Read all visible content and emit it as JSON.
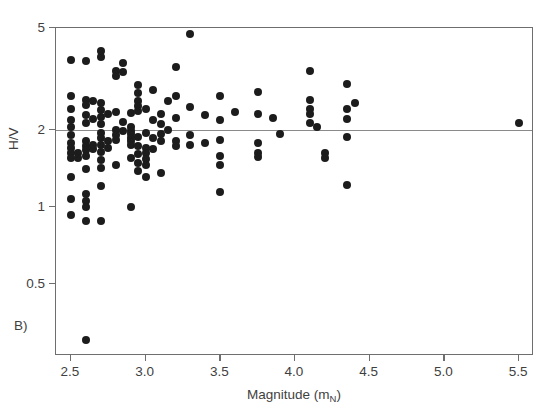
{
  "figure": {
    "panel_label": "B)"
  },
  "chart_data": {
    "type": "scatter",
    "title": "",
    "xlabel": "Magnitude (m_N)",
    "xlabel_base": "Magnitude (m",
    "xlabel_sub": "N",
    "xlabel_tail": ")",
    "ylabel": "H/V",
    "xscale": "linear",
    "yscale": "log",
    "xlim": [
      2.4,
      5.6
    ],
    "ylim": [
      0.26,
      5.0
    ],
    "grid": false,
    "legend": null,
    "xticks": [
      2.5,
      3.0,
      3.5,
      4.0,
      4.5,
      5.0,
      5.5
    ],
    "xticklabels": [
      "2.5",
      "3.0",
      "3.5",
      "4.0",
      "4.5",
      "5.0",
      "5.5"
    ],
    "yticks": [
      5,
      2,
      1,
      0.5
    ],
    "yticklabels": [
      "5",
      "2",
      "1",
      "0.5"
    ],
    "annotations": [
      {
        "type": "hline",
        "y": 2.0,
        "label": "H/V = 2 reference line",
        "color": "#8a8a8a"
      }
    ],
    "marker": {
      "shape": "circle",
      "color": "#1c1c1c",
      "size_px": 8
    },
    "points": [
      [
        2.5,
        3.75
      ],
      [
        2.5,
        2.72
      ],
      [
        2.5,
        2.42
      ],
      [
        2.5,
        2.18
      ],
      [
        2.5,
        2.05
      ],
      [
        2.5,
        1.9
      ],
      [
        2.5,
        1.78
      ],
      [
        2.5,
        1.7
      ],
      [
        2.5,
        1.62
      ],
      [
        2.5,
        1.55
      ],
      [
        2.5,
        1.3
      ],
      [
        2.5,
        1.07
      ],
      [
        2.5,
        0.93
      ],
      [
        2.55,
        1.62
      ],
      [
        2.55,
        1.55
      ],
      [
        2.6,
        3.72
      ],
      [
        2.6,
        2.62
      ],
      [
        2.6,
        2.5
      ],
      [
        2.6,
        2.28
      ],
      [
        2.6,
        2.12
      ],
      [
        2.6,
        1.8
      ],
      [
        2.6,
        1.72
      ],
      [
        2.6,
        1.66
      ],
      [
        2.6,
        1.58
      ],
      [
        2.6,
        1.4
      ],
      [
        2.6,
        1.12
      ],
      [
        2.6,
        1.05
      ],
      [
        2.6,
        1.0
      ],
      [
        2.6,
        0.88
      ],
      [
        2.6,
        0.3
      ],
      [
        2.65,
        2.6
      ],
      [
        2.65,
        2.2
      ],
      [
        2.65,
        1.75
      ],
      [
        2.65,
        1.68
      ],
      [
        2.7,
        4.05
      ],
      [
        2.7,
        3.85
      ],
      [
        2.7,
        2.55
      ],
      [
        2.7,
        2.38
      ],
      [
        2.7,
        2.25
      ],
      [
        2.7,
        2.1
      ],
      [
        2.7,
        1.95
      ],
      [
        2.7,
        1.85
      ],
      [
        2.7,
        1.74
      ],
      [
        2.7,
        1.64
      ],
      [
        2.7,
        1.52
      ],
      [
        2.7,
        1.42
      ],
      [
        2.7,
        1.2
      ],
      [
        2.7,
        0.88
      ],
      [
        2.75,
        2.3
      ],
      [
        2.75,
        1.8
      ],
      [
        2.75,
        1.7
      ],
      [
        2.8,
        3.4
      ],
      [
        2.8,
        3.25
      ],
      [
        2.8,
        2.35
      ],
      [
        2.8,
        2.0
      ],
      [
        2.8,
        1.9
      ],
      [
        2.8,
        1.82
      ],
      [
        2.8,
        1.45
      ],
      [
        2.85,
        3.65
      ],
      [
        2.85,
        3.35
      ],
      [
        2.85,
        2.15
      ],
      [
        2.85,
        1.98
      ],
      [
        2.9,
        2.32
      ],
      [
        2.9,
        2.05
      ],
      [
        2.9,
        1.98
      ],
      [
        2.9,
        1.92
      ],
      [
        2.9,
        1.86
      ],
      [
        2.9,
        1.8
      ],
      [
        2.9,
        1.74
      ],
      [
        2.9,
        1.55
      ],
      [
        2.9,
        1.0
      ],
      [
        2.95,
        2.98
      ],
      [
        2.95,
        2.78
      ],
      [
        2.95,
        2.6
      ],
      [
        2.95,
        2.48
      ],
      [
        2.95,
        2.36
      ],
      [
        2.95,
        1.88
      ],
      [
        2.95,
        1.72
      ],
      [
        2.95,
        1.6
      ],
      [
        2.95,
        1.48
      ],
      [
        2.95,
        1.38
      ],
      [
        3.0,
        2.4
      ],
      [
        3.0,
        1.95
      ],
      [
        3.0,
        1.7
      ],
      [
        3.0,
        1.62
      ],
      [
        3.0,
        1.54
      ],
      [
        3.0,
        1.46
      ],
      [
        3.0,
        1.3
      ],
      [
        3.05,
        2.85
      ],
      [
        3.05,
        2.18
      ],
      [
        3.05,
        1.85
      ],
      [
        3.05,
        1.68
      ],
      [
        3.1,
        2.3
      ],
      [
        3.1,
        2.1
      ],
      [
        3.1,
        1.92
      ],
      [
        3.1,
        1.8
      ],
      [
        3.1,
        1.35
      ],
      [
        3.15,
        2.6
      ],
      [
        3.15,
        2.0
      ],
      [
        3.2,
        3.52
      ],
      [
        3.2,
        2.7
      ],
      [
        3.2,
        2.22
      ],
      [
        3.2,
        1.8
      ],
      [
        3.2,
        1.72
      ],
      [
        3.3,
        4.75
      ],
      [
        3.3,
        2.45
      ],
      [
        3.3,
        1.9
      ],
      [
        3.3,
        1.75
      ],
      [
        3.4,
        2.28
      ],
      [
        3.4,
        1.78
      ],
      [
        3.5,
        2.7
      ],
      [
        3.5,
        2.18
      ],
      [
        3.5,
        1.82
      ],
      [
        3.5,
        1.58
      ],
      [
        3.5,
        1.46
      ],
      [
        3.5,
        1.14
      ],
      [
        3.6,
        2.35
      ],
      [
        3.75,
        2.82
      ],
      [
        3.75,
        2.3
      ],
      [
        3.75,
        1.78
      ],
      [
        3.75,
        1.62
      ],
      [
        3.75,
        1.56
      ],
      [
        3.85,
        2.22
      ],
      [
        3.9,
        1.92
      ],
      [
        4.1,
        3.4
      ],
      [
        4.1,
        2.62
      ],
      [
        4.1,
        2.42
      ],
      [
        4.1,
        2.3
      ],
      [
        4.1,
        2.12
      ],
      [
        4.15,
        2.05
      ],
      [
        4.2,
        1.62
      ],
      [
        4.2,
        1.55
      ],
      [
        4.35,
        3.02
      ],
      [
        4.35,
        2.42
      ],
      [
        4.35,
        2.2
      ],
      [
        4.35,
        1.88
      ],
      [
        4.35,
        1.22
      ],
      [
        4.4,
        2.55
      ],
      [
        5.5,
        2.12
      ]
    ]
  }
}
